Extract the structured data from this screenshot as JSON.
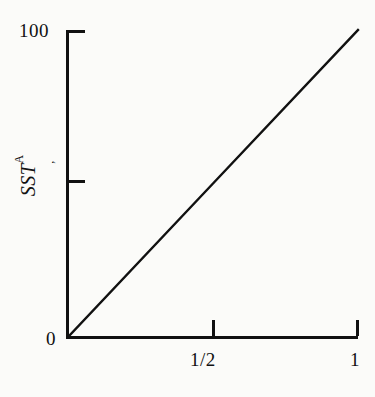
{
  "chart_data": {
    "type": "line",
    "title": "",
    "subtitle": "",
    "xlabel": "",
    "ylabel": "SS^A_T",
    "ylabel_parts": {
      "symbol": "SS",
      "base": "T",
      "superscript": "A",
      "subscript": ","
    },
    "xlim": [
      0,
      1
    ],
    "ylim": [
      0,
      100
    ],
    "grid": false,
    "legend": null,
    "x": [
      0,
      0.5,
      1
    ],
    "series": [
      {
        "name": "SS-A-T",
        "values": [
          0,
          50,
          100
        ],
        "color": "#111111",
        "linewidth": 2.4,
        "style": "solid"
      }
    ],
    "xticks": [
      {
        "value": 0,
        "label": ""
      },
      {
        "value": 0.5,
        "label": "1/2"
      },
      {
        "value": 1,
        "label": "1"
      }
    ],
    "yticks": [
      {
        "value": 0,
        "label": "0"
      },
      {
        "value": 50,
        "label": ""
      },
      {
        "value": 100,
        "label": "100"
      }
    ],
    "annotations": []
  },
  "axes": {
    "y_title_symbol": "SS",
    "y_title_base": "T",
    "y_title_superscript": "A",
    "y_title_subscript": ",",
    "y_tick_top_label": "100",
    "y_tick_mid_label": "",
    "y_tick_zero_label": "0",
    "x_tick_half_label": "1/2",
    "x_tick_one_label": "1"
  },
  "colors": {
    "ink": "#111111",
    "paper": "#fbfbf9"
  }
}
